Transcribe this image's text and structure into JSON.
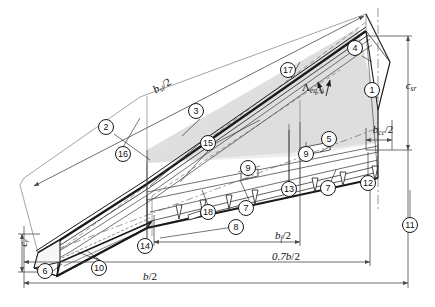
{
  "figure": {
    "kind": "engineering-line-drawing"
  },
  "dimension_labels": [
    {
      "id": "b_sl_half",
      "text_main": "b",
      "text_sub": "sl",
      "text_tail": "/2",
      "x": 162,
      "y": 86,
      "rotate": -30
    },
    {
      "id": "c_sr",
      "text_main": "c",
      "text_sub": "sr",
      "text_tail": "",
      "x": 411,
      "y": 86,
      "rotate": 0
    },
    {
      "id": "b_ce_half",
      "text_main": "b",
      "text_sub": "ce",
      "text_tail": "/2",
      "x": 383,
      "y": 130,
      "rotate": 0
    },
    {
      "id": "c_r",
      "text_main": "c",
      "text_sub": "r",
      "text_tail": "",
      "x": 24,
      "y": 243,
      "rotate": -90
    },
    {
      "id": "b_f_half",
      "text_main": "b",
      "text_sub": "f",
      "text_tail": "/2",
      "x": 283,
      "y": 236,
      "rotate": 0
    },
    {
      "id": "zero7_b_half",
      "text_main": "0.7b",
      "text_sub": "",
      "text_tail": "/2",
      "x": 286,
      "y": 256,
      "rotate": 0
    },
    {
      "id": "b_half",
      "text_main": "b",
      "text_sub": "",
      "text_tail": "/2",
      "x": 150,
      "y": 276,
      "rotate": 0
    }
  ],
  "angle_label": {
    "id": "sweep-angle",
    "glyph": "Λ",
    "sub": "eq,¼",
    "x": 313,
    "y": 88
  },
  "callouts": [
    {
      "n": "1",
      "x": 372,
      "y": 90
    },
    {
      "n": "2",
      "x": 106,
      "y": 127
    },
    {
      "n": "3",
      "x": 196,
      "y": 111
    },
    {
      "n": "4",
      "x": 355,
      "y": 48
    },
    {
      "n": "5",
      "x": 329,
      "y": 139
    },
    {
      "n": "6",
      "x": 45,
      "y": 271
    },
    {
      "n": "7",
      "x": 246,
      "y": 208
    },
    {
      "n": "7",
      "x": 328,
      "y": 188
    },
    {
      "n": "8",
      "x": 236,
      "y": 227
    },
    {
      "n": "9",
      "x": 248,
      "y": 168
    },
    {
      "n": "9",
      "x": 306,
      "y": 154
    },
    {
      "n": "10",
      "x": 99,
      "y": 268
    },
    {
      "n": "11",
      "x": 410,
      "y": 225
    },
    {
      "n": "12",
      "x": 368,
      "y": 183
    },
    {
      "n": "13",
      "x": 289,
      "y": 189
    },
    {
      "n": "14",
      "x": 145,
      "y": 246
    },
    {
      "n": "15",
      "x": 208,
      "y": 143
    },
    {
      "n": "16",
      "x": 123,
      "y": 154
    },
    {
      "n": "17",
      "x": 288,
      "y": 70
    },
    {
      "n": "18",
      "x": 208,
      "y": 212
    }
  ],
  "colors": {
    "line": "#1a1a1a",
    "thin": "#555555",
    "dimension": "#4a4a4a",
    "shaded_panel": "#d9d9d9",
    "background": "#ffffff"
  }
}
